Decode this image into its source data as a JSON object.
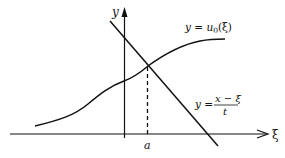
{
  "figure": {
    "type": "diagram",
    "axes": {
      "horizontal_label": "ξ",
      "vertical_label": "y"
    },
    "curves": [
      {
        "id": "u0",
        "label_lhs": "y = ",
        "label_fn": "u",
        "label_sub": "0",
        "label_arg": "(ξ)",
        "full_label": "y = u0(ξ)",
        "shape": "increasing S-shaped curve"
      },
      {
        "id": "line",
        "label_lhs": "y = ",
        "numerator": "x − ξ",
        "denominator": "t",
        "full_label": "y = (x − ξ)/t",
        "shape": "straight line with negative slope"
      }
    ],
    "intersection": {
      "marker": "dashed vertical line",
      "label": "a"
    },
    "colors": {
      "ink": "#111111",
      "background": "#ffffff"
    }
  }
}
